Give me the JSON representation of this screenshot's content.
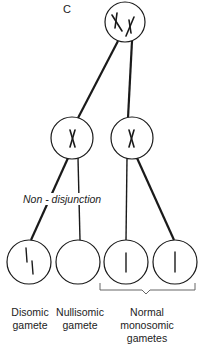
{
  "panel_label": "C",
  "annotation": "Non - disjunction",
  "gametes": [
    {
      "id": "disomic",
      "label_line1": "Disomic",
      "label_line2": "gamete"
    },
    {
      "id": "nullisomic",
      "label_line1": "Nullisomic",
      "label_line2": "gamete"
    },
    {
      "id": "normal",
      "label_line1": "Normal",
      "label_line2": "monosomic",
      "label_line3": "gametes"
    }
  ],
  "colors": {
    "stroke": "#1a1a1a",
    "background": "#ffffff"
  }
}
